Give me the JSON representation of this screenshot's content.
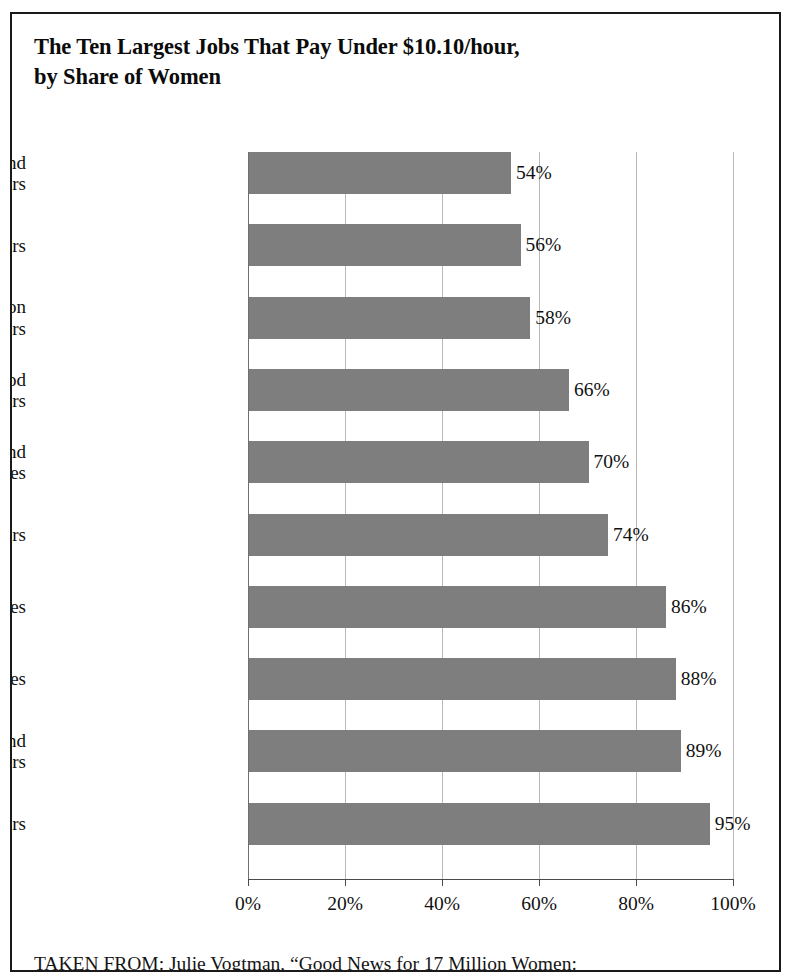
{
  "figure": {
    "title": "The Ten Largest Jobs That Pay Under $10.10/hour,\nby Share of Women",
    "source_caption": "TAKEN FROM: Julie Vogtman, “Good News for 17 Million Women:",
    "frame_color": "#1a1a1a",
    "bar_color": "#7e7e7e",
    "gridline_color": "#b9b9b9",
    "axis_color": "#4a4a4a"
  },
  "chart_data": {
    "type": "bar",
    "orientation": "horizontal",
    "title": "The Ten Largest Jobs That Pay Under $10.10/hour, by Share of Women",
    "xlabel": "",
    "ylabel": "",
    "xlim": [
      0,
      100
    ],
    "grid": true,
    "legend": null,
    "unit": "%",
    "categories": [
      "Hand packers and\npackagers",
      "Bartenders",
      "Food preparation\nworkers",
      "Combined food\npreparers and servers",
      "Waiters and\nwaitresses",
      "Cashiers",
      "Personal care aides",
      "Home health aides",
      "Maids and\nhousekeepers",
      "Child care workers"
    ],
    "values": [
      54,
      56,
      58,
      66,
      70,
      74,
      86,
      88,
      89,
      95
    ],
    "value_labels": [
      "54%",
      "56%",
      "58%",
      "66%",
      "70%",
      "74%",
      "86%",
      "88%",
      "89%",
      "95%"
    ],
    "xticks": [
      0,
      20,
      40,
      60,
      80,
      100
    ],
    "xtick_labels": [
      "0%",
      "20%",
      "40%",
      "60%",
      "80%",
      "100%"
    ]
  }
}
